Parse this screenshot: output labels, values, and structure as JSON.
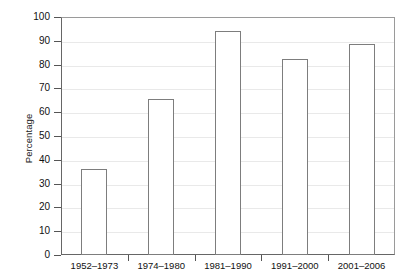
{
  "chart_data": {
    "type": "bar",
    "title": "",
    "subtitle": "",
    "xlabel": "",
    "ylabel": "Percentage",
    "categories": [
      "1952–1973",
      "1974–1980",
      "1981–1990",
      "1991–2000",
      "2001–2006"
    ],
    "values": [
      36,
      65.5,
      94,
      82.5,
      88.5
    ],
    "ylim": [
      0,
      100
    ],
    "y_ticks": [
      0,
      10,
      20,
      30,
      40,
      50,
      60,
      70,
      80,
      90,
      100
    ],
    "y_tick_labels": [
      "0",
      "10",
      "20",
      "30",
      "40",
      "50",
      "60",
      "70",
      "80",
      "90",
      "100"
    ],
    "grid": true,
    "legend": false,
    "legend_position": "none",
    "bar_fill_color": "#ffffff",
    "bar_border_color": "#7d7d7d",
    "gridline_color": "#e9e9e9",
    "axis_color": "#666666",
    "background_color": "#ffffff"
  }
}
